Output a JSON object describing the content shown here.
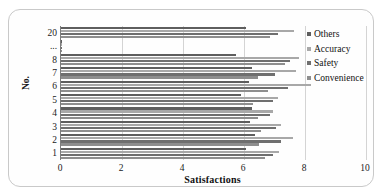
{
  "chart_data": {
    "type": "bar",
    "orientation": "horizontal",
    "title": "",
    "xlabel": "Satisfactions",
    "ylabel": "No.",
    "xlim": [
      0,
      10
    ],
    "xticks": [
      0,
      2,
      4,
      6,
      8,
      10
    ],
    "xtick_labels": [
      "0",
      "2",
      "4",
      "6",
      "8",
      "10"
    ],
    "categories": [
      "1",
      "2",
      "3",
      "4",
      "5",
      "6",
      "7",
      "8",
      "...",
      "20"
    ],
    "grid": "vertical",
    "legend_position": "top-right",
    "series": [
      {
        "name": "Others",
        "color": "#5e5e5e",
        "values": [
          6.05,
          6.35,
          6.2,
          6.25,
          5.9,
          6.15,
          6.25,
          5.75,
          null,
          6.05
        ]
      },
      {
        "name": "Accuracy",
        "color": "#a8a8a8",
        "values": [
          7.15,
          7.6,
          7.2,
          6.95,
          7.1,
          8.2,
          7.7,
          7.8,
          null,
          7.65
        ]
      },
      {
        "name": "Safety",
        "color": "#6f6f6f",
        "values": [
          6.95,
          7.2,
          7.05,
          6.85,
          6.95,
          7.45,
          7.0,
          7.5,
          null,
          7.1
        ]
      },
      {
        "name": "Convenience",
        "color": "#8e8e8e",
        "values": [
          6.7,
          6.5,
          6.55,
          6.45,
          6.3,
          6.8,
          6.45,
          7.35,
          null,
          6.85
        ]
      }
    ]
  },
  "legend": {
    "items": [
      {
        "label": "Others"
      },
      {
        "label": "Accuracy"
      },
      {
        "label": "Safety"
      },
      {
        "label": "Convenience"
      }
    ]
  },
  "axes": {
    "y_title": "No.",
    "x_title": "Satisfactions"
  }
}
